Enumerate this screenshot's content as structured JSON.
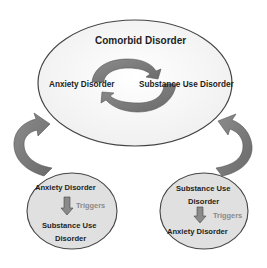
{
  "diagram": {
    "main_ellipse": {
      "title": "Comorbid Disorder",
      "left_label": "Anxiety Disorder",
      "right_label": "Substance Use Disorder"
    },
    "left_circle": {
      "top_label": "Anxiety Disorder",
      "relation": "Triggers",
      "bottom_label_line1": "Substance Use",
      "bottom_label_line2": "Disorder"
    },
    "right_circle": {
      "top_label_line1": "Substance Use",
      "top_label_line2": "Disorder",
      "relation": "Triggers",
      "bottom_label": "Anxiety Disorder"
    },
    "colors": {
      "arrow_fill": "#7a7a7a",
      "arrow_stroke": "#555555",
      "main_fill": "#f4f4f4",
      "circle_fill": "#e0e0e0",
      "outline": "#444444",
      "relation_text": "#8a8a8a"
    }
  }
}
